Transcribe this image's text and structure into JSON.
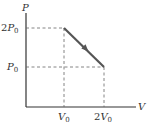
{
  "diagram": {
    "type": "pv-diagram",
    "axes": {
      "y_label": "P",
      "x_label": "V"
    },
    "y_ticks": [
      {
        "label_coef": "2",
        "label_var": "P",
        "label_sub": "0",
        "value": "2P0"
      },
      {
        "label_coef": "",
        "label_var": "P",
        "label_sub": "0",
        "value": "P0"
      }
    ],
    "x_ticks": [
      {
        "label_coef": "",
        "label_var": "V",
        "label_sub": "0",
        "value": "V0"
      },
      {
        "label_coef": "2",
        "label_var": "V",
        "label_sub": "0",
        "value": "2V0"
      }
    ],
    "process": {
      "from": {
        "V": "V0",
        "P": "2P0"
      },
      "to": {
        "V": "2V0",
        "P": "P0"
      },
      "direction": "from (V0, 2P0) to (2V0, P0)"
    },
    "colors": {
      "axis": "#333333",
      "dashed": "#555555",
      "process_line": "#555555",
      "text": "#333333"
    }
  }
}
